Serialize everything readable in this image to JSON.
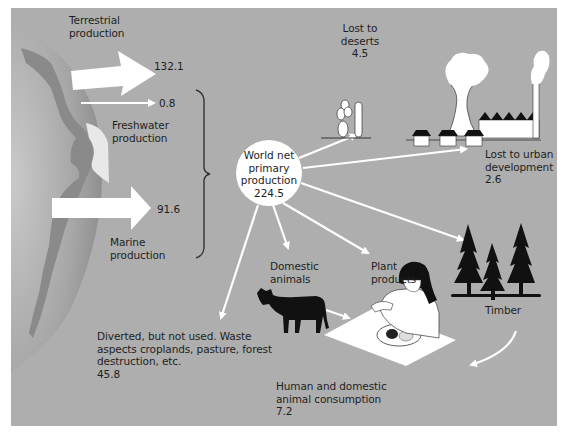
{
  "diagram": {
    "background_color": "#aeaeae",
    "arrow_color": "#ffffff",
    "hub": {
      "line1": "World net",
      "line2": "primary",
      "line3": "production",
      "value": "224.5"
    },
    "inputs": [
      {
        "name_line1": "Terrestrial",
        "name_line2": "production",
        "value": "132.1"
      },
      {
        "name_line1": "Freshwater",
        "name_line2": "production",
        "value": "0.8"
      },
      {
        "name_line1": "Marine",
        "name_line2": "production",
        "value": "91.6"
      }
    ],
    "outputs": {
      "deserts": {
        "line1": "Lost to",
        "line2": "deserts",
        "value": "4.5"
      },
      "urban": {
        "line1": "Lost to urban",
        "line2": "development",
        "value": "2.6"
      },
      "timber": {
        "label": "Timber"
      },
      "plant_products": {
        "line1": "Plant",
        "line2": "products"
      },
      "domestic_animals": {
        "line1": "Domestic",
        "line2": "animals"
      },
      "diverted": {
        "line1": "Diverted, but not used. Waste",
        "line2": "aspects croplands, pasture, forest",
        "line3": "destruction, etc.",
        "value": "45.8"
      },
      "consumption": {
        "line1": "Human and domestic",
        "line2": "animal consumption",
        "value": "7.2"
      }
    },
    "icons": [
      "globe-icon",
      "cactus-icon",
      "power-plant-icon",
      "house-icon",
      "tree-icon",
      "cow-icon",
      "person-eating-icon"
    ]
  }
}
